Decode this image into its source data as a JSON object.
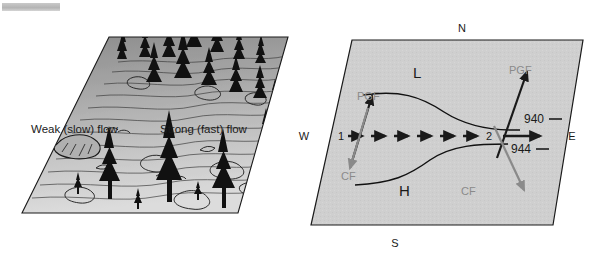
{
  "figure": {
    "title": "",
    "panels": [
      {
        "id": "left-panel",
        "name": "terrain-flow-panel",
        "type": "landscape-block-diagram",
        "labels": {
          "weak_flow": "Weak (slow) flow",
          "strong_flow": "Strong (fast) flow"
        },
        "description": "Forested terrain block with contour-like flow lines",
        "fill_top": "#8f8f8f",
        "fill_bottom": "#d8d8d8"
      },
      {
        "id": "right-panel",
        "name": "pressure-gradient-panel",
        "type": "isobar-map-block-diagram",
        "compass": {
          "north": "N",
          "south": "S",
          "east": "E",
          "west": "W"
        },
        "pressure_centers": {
          "low": "L",
          "high": "H"
        },
        "isobars": [
          {
            "value": "940",
            "tick": "—"
          },
          {
            "value": "944",
            "tick": "—"
          }
        ],
        "points": [
          {
            "label": "1"
          },
          {
            "label": "2"
          }
        ],
        "force_vectors": [
          {
            "name": "pgf-left",
            "label": "PGF",
            "color": "#1a1a1a",
            "direction": "up-right"
          },
          {
            "name": "pgf-right",
            "label": "PGF",
            "color": "#1a1a1a",
            "direction": "up-right"
          },
          {
            "name": "cf-left",
            "label": "CF",
            "color": "#8a8a8a",
            "direction": "down-left"
          },
          {
            "name": "cf-right",
            "label": "CF",
            "color": "#8a8a8a",
            "direction": "down-right"
          }
        ],
        "wind_arrows": {
          "name": "geostrophic-wind-flow",
          "count": 7,
          "direction": "west-to-east"
        },
        "fill": "#d0d0d0"
      }
    ],
    "colors": {
      "panel_fill_right": "#d0d0d0",
      "panel_fill_left_top": "#8f8f8f",
      "panel_fill_left_bottom": "#d8d8d8",
      "outline": "#1a1a1a",
      "label_dark": "#1a1a1a",
      "label_gray": "#8a8a8a",
      "background": "#ffffff"
    }
  }
}
